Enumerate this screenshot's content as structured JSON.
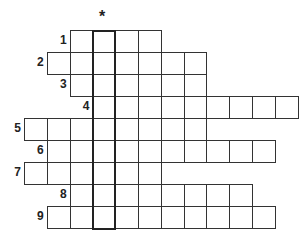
{
  "puzzle": {
    "marker": "*",
    "key_column": 3,
    "grid_origin": {
      "x": 24,
      "y": 30
    },
    "cell_size": {
      "w": 22.8,
      "h": 22
    },
    "rows": [
      {
        "number": "1",
        "start_col": 2,
        "length": 4
      },
      {
        "number": "2",
        "start_col": 1,
        "length": 7
      },
      {
        "number": "3",
        "start_col": 2,
        "length": 6
      },
      {
        "number": "4",
        "start_col": 3,
        "length": 9
      },
      {
        "number": "5",
        "start_col": 0,
        "length": 8
      },
      {
        "number": "6",
        "start_col": 1,
        "length": 10
      },
      {
        "number": "7",
        "start_col": 0,
        "length": 6
      },
      {
        "number": "8",
        "start_col": 2,
        "length": 8
      },
      {
        "number": "9",
        "start_col": 1,
        "length": 10
      }
    ]
  }
}
